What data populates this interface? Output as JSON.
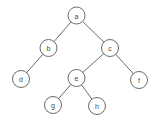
{
  "figure": {
    "type": "binary-tree-diagram",
    "background_color": "#ffffff",
    "stroke_color": "#6b6b6b",
    "label_color": "#4a4a4a",
    "node_fill": "#ffffff",
    "node_radius": 8.5,
    "width": 157,
    "height": 119
  },
  "nodes": [
    {
      "id": "a",
      "label": "a",
      "x": 76.5,
      "y": 15.5,
      "level": 0
    },
    {
      "id": "b",
      "label": "b",
      "x": 48.5,
      "y": 48.0,
      "level": 1
    },
    {
      "id": "c",
      "label": "c",
      "x": 110.0,
      "y": 48.0,
      "level": 1
    },
    {
      "id": "d",
      "label": "d",
      "x": 21.0,
      "y": 79.0,
      "level": 2
    },
    {
      "id": "e",
      "label": "e",
      "x": 76.5,
      "y": 78.0,
      "level": 2
    },
    {
      "id": "f",
      "label": "f",
      "x": 139.0,
      "y": 80.0,
      "level": 2
    },
    {
      "id": "g",
      "label": "g",
      "x": 53.0,
      "y": 105.0,
      "level": 3
    },
    {
      "id": "h",
      "label": "h",
      "x": 97.0,
      "y": 106.0,
      "level": 3
    }
  ],
  "edges": [
    {
      "from": "a",
      "to": "b",
      "side": "left"
    },
    {
      "from": "a",
      "to": "c",
      "side": "right"
    },
    {
      "from": "b",
      "to": "d",
      "side": "left"
    },
    {
      "from": "c",
      "to": "e",
      "side": "left"
    },
    {
      "from": "c",
      "to": "f",
      "side": "right"
    },
    {
      "from": "e",
      "to": "g",
      "side": "left"
    },
    {
      "from": "e",
      "to": "h",
      "side": "right"
    }
  ]
}
